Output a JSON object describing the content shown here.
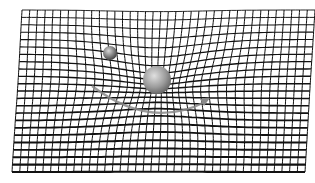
{
  "image": {
    "subject": "spacetime curvature illustration",
    "description": "Warped black grid forming a gravity well, with a large sphere at center, a small sphere orbiting upper-left, and a grey orbital arc with arrow",
    "colors": {
      "background": "#ffffff",
      "grid": "#111111",
      "orbit": "#8a8a8a",
      "large_sphere": "#9a9a9a",
      "small_sphere": "#7a7a7a"
    },
    "elements": {
      "large_sphere": {
        "cx": 157,
        "cy": 80,
        "r": 14
      },
      "small_sphere": {
        "cx": 110,
        "cy": 53,
        "r": 7
      },
      "grid_bounds": {
        "x": 12,
        "y": 10,
        "w": 293,
        "h": 162
      }
    }
  }
}
